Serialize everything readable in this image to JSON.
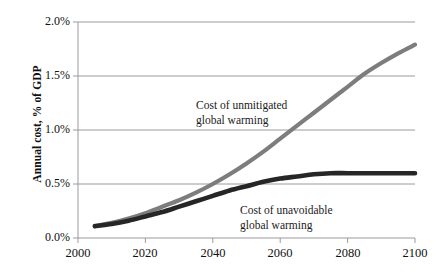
{
  "chart_data": {
    "type": "line",
    "title": "",
    "subtitle": "",
    "xlabel": "",
    "ylabel": "Annual cost, % of GDP",
    "xlim": [
      2000,
      2100
    ],
    "ylim": [
      0.0,
      2.0
    ],
    "grid": true,
    "grid_axis": "y",
    "legend_position": "inline-annotations",
    "x_tick_labels": [
      "2000",
      "2020",
      "2040",
      "2060",
      "2080",
      "2100"
    ],
    "x_ticks": [
      2000,
      2020,
      2040,
      2060,
      2080,
      2100
    ],
    "y_tick_labels": [
      "0.0%",
      "0.5%",
      "1.0%",
      "1.5%",
      "2.0%"
    ],
    "y_ticks": [
      0.0,
      0.5,
      1.0,
      1.5,
      2.0
    ],
    "y_unit": "%",
    "series": [
      {
        "name": "Cost of unmitigated global warming",
        "color": "#7d7d7d",
        "width": 4.2,
        "x": [
          2005,
          2010,
          2015,
          2020,
          2025,
          2030,
          2035,
          2040,
          2045,
          2050,
          2055,
          2060,
          2065,
          2070,
          2075,
          2080,
          2085,
          2090,
          2095,
          2100
        ],
        "values": [
          0.11,
          0.14,
          0.18,
          0.23,
          0.29,
          0.35,
          0.42,
          0.5,
          0.59,
          0.69,
          0.8,
          0.92,
          1.04,
          1.16,
          1.28,
          1.4,
          1.52,
          1.62,
          1.71,
          1.79
        ]
      },
      {
        "name": "Cost of unavoidable global warming",
        "color": "#262626",
        "width": 4.6,
        "x": [
          2005,
          2010,
          2015,
          2020,
          2025,
          2030,
          2035,
          2040,
          2045,
          2050,
          2055,
          2060,
          2065,
          2070,
          2075,
          2080,
          2085,
          2090,
          2095,
          2100
        ],
        "values": [
          0.11,
          0.13,
          0.16,
          0.2,
          0.24,
          0.29,
          0.34,
          0.39,
          0.44,
          0.48,
          0.52,
          0.55,
          0.57,
          0.59,
          0.6,
          0.6,
          0.6,
          0.6,
          0.6,
          0.6
        ]
      }
    ],
    "annotations": [
      {
        "id": "unmitigated",
        "line1": "Cost of unmitigated",
        "line2": "global warming",
        "series": "Cost of unmitigated global warming"
      },
      {
        "id": "unavoidable",
        "line1": "Cost of unavoidable",
        "line2": "global warming",
        "series": "Cost of unavoidable global warming"
      }
    ],
    "axis_color": "#9a9a9a",
    "grid_color": "#9a9a9a",
    "text_color": "#111111",
    "background": "#ffffff"
  }
}
